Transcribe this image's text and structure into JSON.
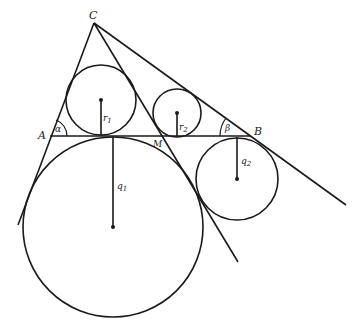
{
  "figure": {
    "type": "geometry-diagram",
    "points": {
      "A": {
        "label": "A",
        "x": 50,
        "y": 136
      },
      "B": {
        "label": "B",
        "x": 250,
        "y": 136
      },
      "C": {
        "label": "C",
        "x": 94,
        "y": 23
      },
      "M": {
        "label": "M",
        "x": 162,
        "y": 137
      }
    },
    "angles": {
      "alpha": {
        "label": "α",
        "vertex": "A"
      },
      "beta": {
        "label": "β",
        "vertex": "B"
      }
    },
    "circles": [
      {
        "name": "incircle-1",
        "radius_label": "r",
        "subscript": "1",
        "cx": 101,
        "cy": 100,
        "r": 35
      },
      {
        "name": "incircle-2",
        "radius_label": "r",
        "subscript": "2",
        "cx": 177,
        "cy": 113,
        "r": 24
      },
      {
        "name": "excircle-1",
        "radius_label": "q",
        "subscript": "1",
        "cx": 113,
        "cy": 227,
        "r": 90
      },
      {
        "name": "excircle-2",
        "radius_label": "q",
        "subscript": "2",
        "cx": 237,
        "cy": 179,
        "r": 41
      }
    ],
    "colors": {
      "stroke": "#1a1a1a",
      "background": "#ffffff"
    }
  }
}
